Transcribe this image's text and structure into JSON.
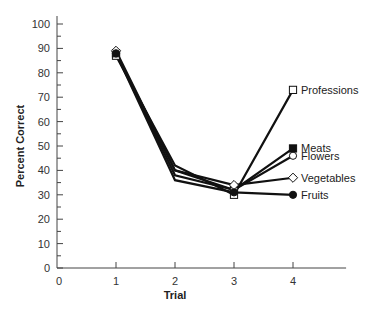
{
  "chart_data": {
    "type": "line",
    "title": "",
    "xlabel": "Trial",
    "ylabel": "Percent Correct",
    "x": [
      1,
      2,
      3,
      4
    ],
    "x_ticks": [
      0,
      1,
      2,
      3,
      4
    ],
    "y_ticks": [
      0,
      10,
      20,
      30,
      40,
      50,
      60,
      70,
      80,
      90,
      100
    ],
    "xlim": [
      0,
      4.9
    ],
    "ylim": [
      0,
      100
    ],
    "grid": false,
    "legend_position": "inline-right-end-of-lines",
    "series": [
      {
        "name": "Professions",
        "marker": "open-square",
        "values": [
          87,
          42,
          30,
          73
        ]
      },
      {
        "name": "Meats",
        "marker": "filled-square",
        "values": [
          88,
          40,
          32,
          49
        ]
      },
      {
        "name": "Flowers",
        "marker": "open-circle",
        "values": [
          88,
          38,
          32,
          46
        ]
      },
      {
        "name": "Vegetables",
        "marker": "open-diamond",
        "values": [
          89,
          40,
          34,
          37
        ]
      },
      {
        "name": "Fruits",
        "marker": "filled-circle",
        "values": [
          88,
          36,
          31,
          30
        ]
      }
    ]
  }
}
